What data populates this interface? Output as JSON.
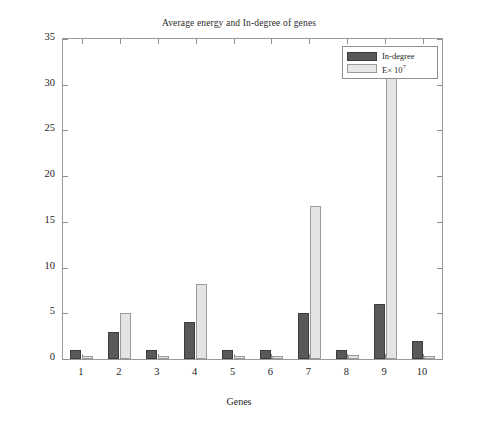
{
  "chart_data": {
    "type": "bar",
    "title": "Average energy and In-degree of genes",
    "xlabel": "Genes",
    "ylabel": "",
    "categories": [
      "1",
      "2",
      "3",
      "4",
      "5",
      "6",
      "7",
      "8",
      "9",
      "10"
    ],
    "series": [
      {
        "name": "In-degree",
        "color": "#595959",
        "values": [
          1,
          3,
          1,
          4,
          1,
          1,
          5,
          1,
          6,
          2
        ]
      },
      {
        "name": "E× 10⁷",
        "color": "#e4e4e4",
        "values": [
          0.3,
          5,
          0.3,
          8.2,
          0.3,
          0.3,
          16.7,
          0.4,
          34,
          0.3
        ]
      }
    ],
    "ylim": [
      0,
      35
    ],
    "yticks": [
      0,
      5,
      10,
      15,
      20,
      25,
      30,
      35
    ],
    "ytick_labels": [
      "0",
      "5",
      "10",
      "15",
      "20",
      "25",
      "30",
      "35"
    ],
    "xtick_labels": [
      "1",
      "2",
      "3",
      "4",
      "5",
      "6",
      "7",
      "8",
      "9",
      "10"
    ],
    "grid": false,
    "legend_position": "top-right"
  },
  "legend": {
    "entries": [
      {
        "label": "In-degree",
        "exponent": ""
      },
      {
        "label": "E× 10",
        "exponent": "7"
      }
    ]
  },
  "axis": {
    "x_title": "Genes",
    "y_title": ""
  }
}
